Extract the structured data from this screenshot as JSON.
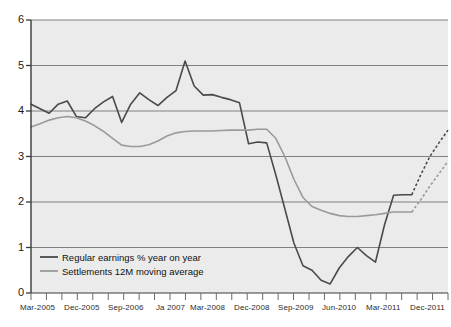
{
  "chart_data": {
    "type": "line",
    "title": "",
    "subtitle": "",
    "xlabel": "",
    "ylabel": "",
    "ylim": [
      0,
      6
    ],
    "yticks": [
      0,
      1,
      2,
      3,
      4,
      5,
      6
    ],
    "ytick_labels": [
      "0",
      "1",
      "2",
      "3",
      "4",
      "5",
      "6"
    ],
    "grid": "horizontal",
    "legend_position": "bottom-left",
    "plot_background": "#ebebeb",
    "gridline_color": "#808080",
    "axis_color": "#3a3a3a",
    "x_tick_count": 28,
    "x_labeled_ticks": [
      {
        "index": 0,
        "label": "Mar-2005"
      },
      {
        "index": 3,
        "label": "Dec-2005"
      },
      {
        "index": 6,
        "label": "Sep-2006"
      },
      {
        "index": 9,
        "label": "Ja 2007"
      },
      {
        "index": 12,
        "label": "Mar-2008"
      },
      {
        "index": 15,
        "label": "Dec-2008"
      },
      {
        "index": 18,
        "label": "Sep-2009"
      },
      {
        "index": 21,
        "label": "Jun-2010"
      },
      {
        "index": 24,
        "label": "Mar-2011"
      },
      {
        "index": 27,
        "label": "Dec-2011"
      }
    ],
    "series": [
      {
        "name": "Regular earnings % year on year",
        "color": "#4a4a4a",
        "style": "solid",
        "width": 1.6,
        "values": [
          4.15,
          4.05,
          3.95,
          4.15,
          4.22,
          3.88,
          3.85,
          4.05,
          4.2,
          4.32,
          3.75,
          4.15,
          4.4,
          4.25,
          4.12,
          4.3,
          4.45,
          5.1,
          4.55,
          4.35,
          4.36,
          4.3,
          4.25,
          4.18,
          3.28,
          3.32,
          3.3,
          2.6,
          1.85,
          1.1,
          0.6,
          0.5,
          0.28,
          0.2,
          0.55,
          0.8,
          1.0,
          0.82,
          0.68,
          1.5,
          2.15,
          2.16,
          2.16
        ],
        "forecast": {
          "style": "dashed",
          "values": [
            2.16,
            2.6,
            3.0,
            3.3,
            3.58
          ]
        }
      },
      {
        "name": "Settlements 12M moving average",
        "color": "#9a9a9a",
        "style": "solid",
        "width": 1.6,
        "values": [
          3.65,
          3.72,
          3.8,
          3.85,
          3.88,
          3.85,
          3.78,
          3.68,
          3.55,
          3.4,
          3.25,
          3.22,
          3.22,
          3.26,
          3.34,
          3.45,
          3.52,
          3.55,
          3.56,
          3.56,
          3.56,
          3.57,
          3.58,
          3.58,
          3.58,
          3.6,
          3.6,
          3.4,
          3.0,
          2.5,
          2.1,
          1.9,
          1.82,
          1.75,
          1.7,
          1.68,
          1.68,
          1.7,
          1.72,
          1.75,
          1.78,
          1.78,
          1.78
        ],
        "forecast": {
          "style": "dashed",
          "values": [
            1.78,
            2.05,
            2.35,
            2.62,
            2.9
          ]
        }
      }
    ],
    "legend": [
      {
        "label": "Regular earnings % year on year",
        "color": "#4a4a4a"
      },
      {
        "label": "Settlements 12M moving average",
        "color": "#9a9a9a"
      }
    ]
  }
}
